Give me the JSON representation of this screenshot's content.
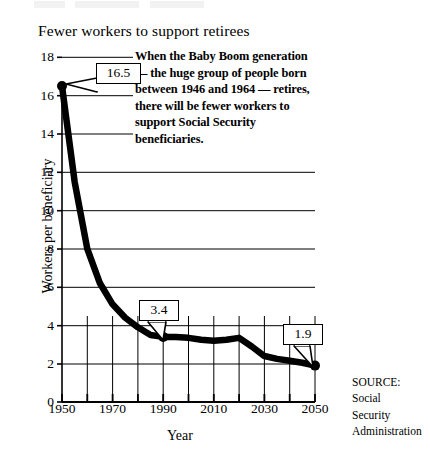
{
  "chart_data": {
    "type": "line",
    "title": "Fewer workers to support retirees",
    "xlabel": "Year",
    "ylabel": "Workers per beneficiary",
    "xlim": [
      1950,
      2050
    ],
    "ylim": [
      0,
      18
    ],
    "ytick_labels": [
      "0",
      "2",
      "4",
      "6",
      "8",
      "10",
      "12",
      "14",
      "16",
      "18"
    ],
    "ytick_values": [
      0,
      2,
      4,
      6,
      8,
      10,
      12,
      14,
      16,
      18
    ],
    "xtick_labels": [
      "1950",
      "1970",
      "1990",
      "2010",
      "2030",
      "2050"
    ],
    "xtick_values": [
      1950,
      1970,
      1990,
      2010,
      2030,
      2050
    ],
    "xtick_minor_values": [
      1960,
      1980,
      2000,
      2020,
      2040
    ],
    "grid": "horizontal gridlines at every even value; vertical gridlines at each decade below y=4.5",
    "legend": "none",
    "x": [
      1950,
      1955,
      1960,
      1965,
      1970,
      1975,
      1980,
      1985,
      1990,
      1995,
      2000,
      2005,
      2010,
      2015,
      2020,
      2025,
      2030,
      2035,
      2040,
      2045,
      2050
    ],
    "values": [
      16.5,
      11.5,
      8.0,
      6.2,
      5.1,
      4.4,
      3.9,
      3.5,
      3.4,
      3.4,
      3.35,
      3.25,
      3.2,
      3.25,
      3.35,
      2.9,
      2.4,
      2.25,
      2.15,
      2.05,
      1.9
    ],
    "markers": [
      {
        "x": 1950,
        "y": 16.5,
        "label": "16.5"
      },
      {
        "x": 1990,
        "y": 3.4,
        "label": "3.4"
      },
      {
        "x": 2050,
        "y": 1.9,
        "label": "1.9"
      }
    ],
    "annotations": [
      {
        "name": "baby-boom-note",
        "text": "When the Baby Boom generation — the huge group of people born between 1946 and 1964 — retires, there will be fewer workers to support Social Security beneficiaries."
      }
    ],
    "source": "SOURCE: Social Security Administration"
  },
  "chart": {
    "title": "Fewer workers to support retirees",
    "xlabel": "Year",
    "ylabel": "Workers per beneficiary"
  },
  "annotation": {
    "line1": "When the Baby Boom generation",
    "line2": "— the huge group of people born",
    "line3": "between 1946 and 1964 — retires,",
    "line4": "there will be fewer workers  to",
    "line5": "support Social Security",
    "line6": "beneficiaries."
  },
  "callouts": {
    "first": "16.5",
    "middle": "3.4",
    "last": "1.9"
  },
  "source": {
    "label": "SOURCE:",
    "line1": "Social",
    "line2": "Security",
    "line3": "Administration"
  },
  "colors": {
    "line": "#000000",
    "grid": "#000000",
    "background": "#ffffff"
  }
}
